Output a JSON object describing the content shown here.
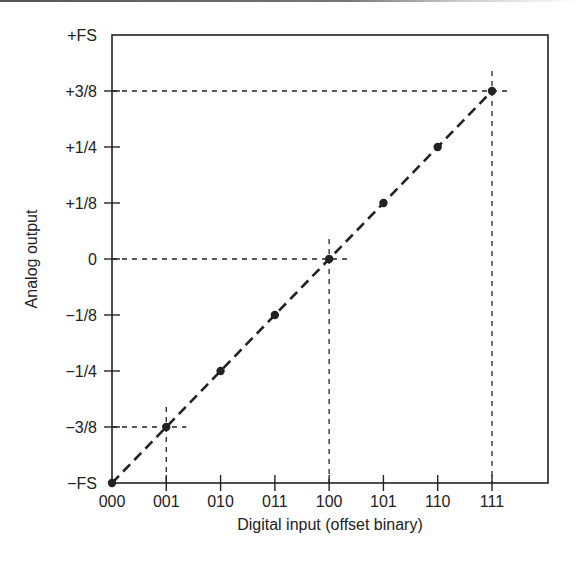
{
  "chart_data": {
    "type": "line",
    "title": "",
    "xlabel": "Digital input (offset binary)",
    "ylabel": "Analog output",
    "categories": [
      "000",
      "001",
      "010",
      "011",
      "100",
      "101",
      "110",
      "111"
    ],
    "y_tick_labels": [
      "−FS",
      "−3/8",
      "−1/4",
      "−1/8",
      "0",
      "+1/8",
      "+1/4",
      "+3/8",
      "+FS"
    ],
    "y_tick_values": [
      -0.5,
      -0.375,
      -0.25,
      -0.125,
      0,
      0.125,
      0.25,
      0.375,
      0.5
    ],
    "series": [
      {
        "name": "Transfer function",
        "style": "dashed line with dot markers",
        "values": [
          -0.5,
          -0.375,
          -0.25,
          -0.125,
          0,
          0.125,
          0.25,
          0.375
        ]
      }
    ],
    "reference_lines": [
      {
        "at_x": "001",
        "at_y": -0.375,
        "style": "dashed"
      },
      {
        "at_x": "100",
        "at_y": 0,
        "style": "dashed"
      },
      {
        "at_x": "111",
        "at_y": 0.375,
        "style": "dashed"
      }
    ],
    "ylim": [
      -0.5,
      0.5
    ],
    "grid": false,
    "legend": "none"
  },
  "colors": {
    "ink": "#222222",
    "background": "#ffffff"
  }
}
